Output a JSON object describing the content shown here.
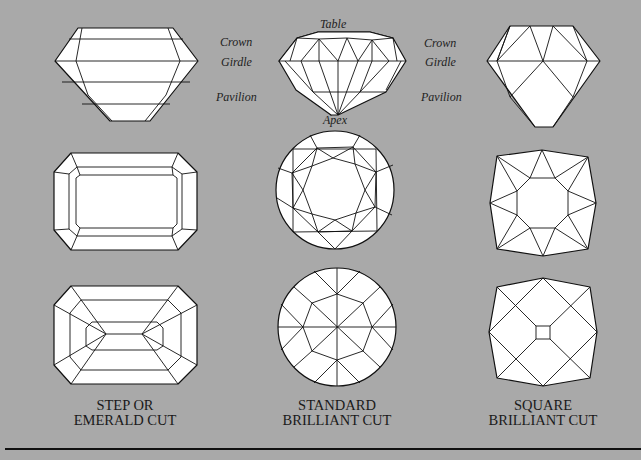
{
  "background_color": "#a9a9a9",
  "labels": {
    "left_crown": "Crown",
    "left_girdle": "Girdle",
    "left_pavilion": "Pavilion",
    "table": "Table",
    "apex": "Apex",
    "right_crown": "Crown",
    "right_girdle": "Girdle",
    "right_pavilion": "Pavilion"
  },
  "cuts": [
    {
      "line1": "STEP OR",
      "line2": "EMERALD CUT"
    },
    {
      "line1": "STANDARD",
      "line2": "BRILLIANT CUT"
    },
    {
      "line1": "SQUARE",
      "line2": "BRILLIANT CUT"
    }
  ],
  "views": [
    "side-profile",
    "top-view",
    "bottom-view"
  ]
}
